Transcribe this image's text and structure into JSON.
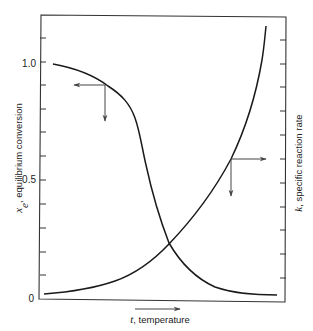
{
  "figure": {
    "left_axis": {
      "label_var": "x",
      "label_sub": "e",
      "label_text": ", equilibrium conversion",
      "ticks": [
        {
          "value": "1.0",
          "y": 64
        },
        {
          "value": "0.5",
          "y": 180
        },
        {
          "value": "0",
          "y": 298
        }
      ]
    },
    "right_axis": {
      "label_var": "k",
      "label_text": ", specific reaction rate"
    },
    "x_axis": {
      "label_var": "t",
      "label_text": ", temperature",
      "direction": "increasing"
    },
    "curves": [
      {
        "name": "equilibrium-conversion",
        "trend": "decreasing",
        "description": "x_e vs t"
      },
      {
        "name": "specific-reaction-rate",
        "trend": "increasing",
        "description": "k vs t"
      }
    ],
    "colors": {
      "line": "#1a1a1a",
      "axis": "#333333",
      "arrow": "#444444"
    }
  }
}
